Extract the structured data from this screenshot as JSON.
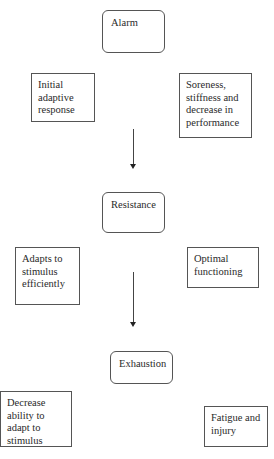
{
  "diagram": {
    "type": "flowchart",
    "stages": [
      {
        "id": "alarm",
        "label": "Alarm",
        "notes": [
          {
            "side": "left",
            "lines": [
              "Initial",
              "adaptive",
              "response"
            ]
          },
          {
            "side": "right",
            "lines": [
              "Soreness,",
              "stiffness and",
              "decrease in",
              "performance"
            ]
          }
        ]
      },
      {
        "id": "resistance",
        "label": "Resistance",
        "notes": [
          {
            "side": "left",
            "lines": [
              "Adapts to",
              "stimulus",
              "efficiently"
            ]
          },
          {
            "side": "right",
            "lines": [
              "Optimal",
              "functioning"
            ]
          }
        ]
      },
      {
        "id": "exhaustion",
        "label": "Exhaustion",
        "notes": [
          {
            "side": "left",
            "lines": [
              "Decrease",
              "ability to",
              "adapt to",
              "stimulus"
            ]
          },
          {
            "side": "right",
            "lines": [
              "Fatigue and",
              "injury"
            ]
          }
        ]
      }
    ],
    "edges": [
      {
        "from": "alarm",
        "to": "resistance"
      },
      {
        "from": "resistance",
        "to": "exhaustion"
      }
    ],
    "colors": {
      "border": "#555555",
      "text": "#2a2a2a",
      "background": "#ffffff"
    }
  }
}
